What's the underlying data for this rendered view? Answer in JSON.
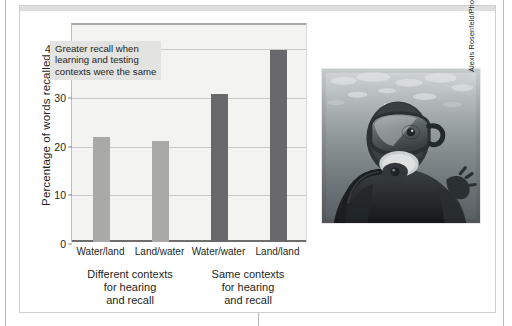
{
  "figure": {
    "credit": "Alexis Rosenfeld/Photo Researchers, Inc.",
    "photo_alt": "scuba-diver-underwater"
  },
  "chart_data": {
    "type": "bar",
    "title": "",
    "xlabel": "",
    "ylabel": "Percentage of words recalled",
    "ylim": [
      0,
      45
    ],
    "yticks": [
      0,
      10,
      20,
      30,
      40
    ],
    "ytick_labels": [
      "0",
      "10",
      "20",
      "30",
      "40%"
    ],
    "grid": true,
    "legend": "none",
    "categories": [
      "Water/land",
      "Land/water",
      "Water/water",
      "Land/land"
    ],
    "values": [
      21.5,
      20.8,
      30.5,
      39.5
    ],
    "bar_colors": [
      "#a9a9a7",
      "#a9a9a7",
      "#68686a",
      "#68686a"
    ],
    "groups": [
      {
        "label": "Different contexts\nfor hearing\nand recall",
        "line1": "Different contexts",
        "line2": "for hearing",
        "line3": "and recall",
        "categories": [
          "Water/land",
          "Land/water"
        ]
      },
      {
        "label": "Same contexts\nfor hearing\nand recall",
        "line1": "Same contexts",
        "line2": "for hearing",
        "line3": "and recall",
        "categories": [
          "Water/water",
          "Land/land"
        ]
      }
    ],
    "annotations": [
      {
        "text": "Greater recall when learning and testing contexts were the same",
        "line1": "Greater recall when",
        "line2": "learning and testing",
        "line3": "contexts were the same"
      }
    ],
    "colors": {
      "plot_background": "#f3f3f1",
      "gridline": "#c9c9c7",
      "axis": "#6d6d6b",
      "bar_light": "#a9a9a7",
      "bar_dark": "#68686a",
      "annotation_background": "#e3e3e1",
      "text": "#231f20"
    }
  }
}
